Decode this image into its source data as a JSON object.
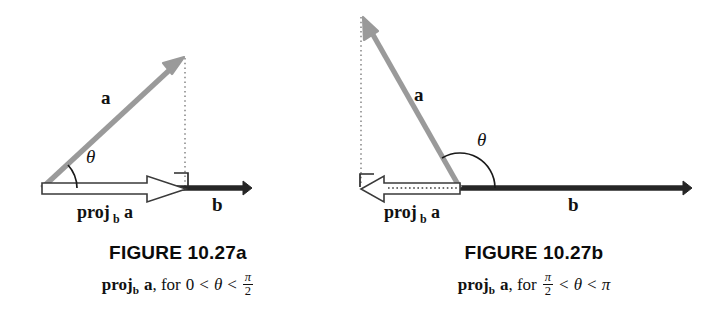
{
  "figure": {
    "kind": "vector-projection-diagram",
    "colors": {
      "vector_a": "#9a9a9a",
      "vector_b": "#262626",
      "projection_outline": "#3a3a3a",
      "projection_fill": "#ffffff",
      "dotted_guide": "#8c8c8c",
      "text": "#111111",
      "background": "#ffffff"
    },
    "panels": [
      {
        "id": "a",
        "title": "FIGURE 10.27a",
        "subtitle_parts": {
          "proj": "proj",
          "sub_b": "b",
          "vec_a": "a",
          "for": ", for",
          "lower": "0",
          "lt1": "<",
          "theta": "θ",
          "lt2": "<",
          "upper_num": "π",
          "upper_den": "2"
        },
        "labels": {
          "vector_a": "a",
          "vector_b": "b",
          "theta": "θ",
          "projection": "proj",
          "projection_sub": "b",
          "projection_vec": "a"
        },
        "geometry": {
          "origin": [
            42,
            188
          ],
          "a_tip": [
            183,
            58
          ],
          "b_tip": [
            250,
            188
          ],
          "projection_tip": [
            186,
            188
          ],
          "angle_deg": 42,
          "theta_arc_radius": 35,
          "right_angle_marker": true,
          "dotted_drop_x": 185,
          "projection_direction": "right"
        }
      },
      {
        "id": "b",
        "title": "FIGURE 10.27b",
        "subtitle_parts": {
          "proj": "proj",
          "sub_b": "b",
          "vec_a": "a",
          "for": ", for",
          "lower_num": "π",
          "lower_den": "2",
          "lt1": "<",
          "theta": "θ",
          "lt2": "<",
          "upper": "π"
        },
        "labels": {
          "vector_a": "a",
          "vector_b": "b",
          "theta": "θ",
          "projection": "proj",
          "projection_sub": "b",
          "projection_vec": "a"
        },
        "geometry": {
          "origin": [
            104,
            188
          ],
          "a_tip": [
            7,
            17
          ],
          "b_tip": [
            334,
            188
          ],
          "projection_tip": [
            5,
            188
          ],
          "angle_deg": 120,
          "theta_arc_radius": 35,
          "right_angle_marker": true,
          "dotted_drop_x": 5,
          "projection_direction": "left"
        }
      }
    ]
  }
}
